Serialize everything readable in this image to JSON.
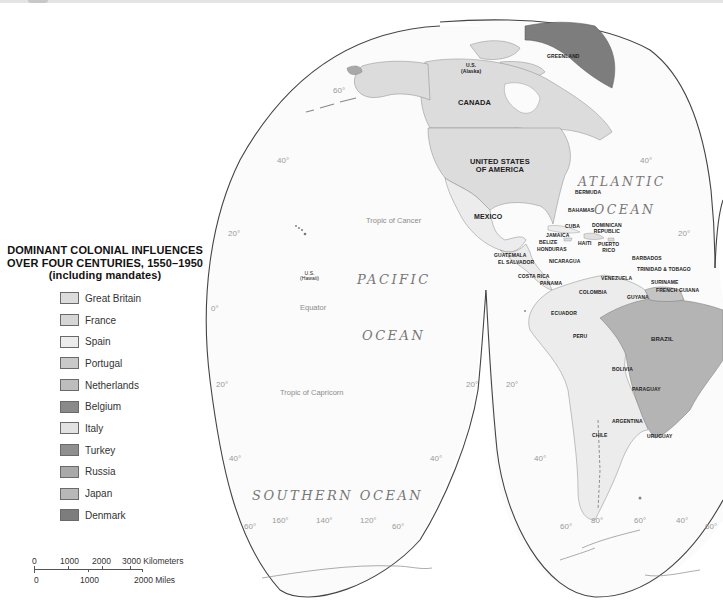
{
  "legend": {
    "title_line1": "DOMINANT COLONIAL INFLUENCES",
    "title_line2": "OVER FOUR CENTURIES, 1550–1950",
    "title_line3": "(including mandates)",
    "items": [
      {
        "label": "Great Britain",
        "color": "#dcdcdc"
      },
      {
        "label": "France",
        "color": "#d6d6d6"
      },
      {
        "label": "Spain",
        "color": "#ececec"
      },
      {
        "label": "Portugal",
        "color": "#c9c9c9"
      },
      {
        "label": "Netherlands",
        "color": "#bdbdbd"
      },
      {
        "label": "Belgium",
        "color": "#8a8a8a"
      },
      {
        "label": "Italy",
        "color": "#e2e2e2"
      },
      {
        "label": "Turkey",
        "color": "#8f8f8f"
      },
      {
        "label": "Russia",
        "color": "#a9a9a9"
      },
      {
        "label": "Japan",
        "color": "#b8b8b8"
      },
      {
        "label": "Denmark",
        "color": "#7d7d7d"
      }
    ]
  },
  "scale_bar": {
    "km_labels": [
      "0",
      "1000",
      "2000",
      "3000 Kilometers"
    ],
    "mi_labels": [
      "0",
      "1000",
      "2000 Miles"
    ]
  },
  "oceans": {
    "atlantic_line1": "ATLANTIC",
    "atlantic_line2": "OCEAN",
    "pacific_line1": "PACIFIC",
    "pacific_line2": "OCEAN",
    "southern": "SOUTHERN OCEAN"
  },
  "lines": {
    "tropic_cancer": "Tropic of Cancer",
    "equator": "Equator",
    "tropic_capricorn": "Tropic of Capricorn"
  },
  "countries": {
    "greenland": "GREENLAND",
    "alaska_1": "U.S.",
    "alaska_2": "(Alaska)",
    "canada": "CANADA",
    "usa_1": "UNITED STATES",
    "usa_2": "OF AMERICA",
    "mexico": "MEXICO",
    "hawaii_1": "U.S.",
    "hawaii_2": "(Hawaii)",
    "bermuda": "BERMUDA",
    "bahamas": "BAHAMAS",
    "cuba": "CUBA",
    "dominican_1": "DOMINICAN",
    "dominican_2": "REPUBLIC",
    "jamaica": "JAMAICA",
    "haiti": "HAITI",
    "puerto_rico_1": "PUERTO",
    "puerto_rico_2": "RICO",
    "belize": "BELIZE",
    "honduras": "HONDURAS",
    "guatemala": "GUATEMALA",
    "el_salvador": "EL SALVADOR",
    "nicaragua": "NICARAGUA",
    "costa_rica": "COSTA RICA",
    "panama": "PANAMA",
    "barbados": "BARBADOS",
    "trinidad": "TRINIDAD & TOBAGO",
    "venezuela": "VENEZUELA",
    "suriname": "SURINAME",
    "french_guiana": "FRENCH GUIANA",
    "guyana": "GUYANA",
    "colombia": "COLOMBIA",
    "ecuador": "ECUADOR",
    "peru": "PERU",
    "brazil": "BRAZIL",
    "bolivia": "BOLIVIA",
    "paraguay": "PARAGUAY",
    "argentina": "ARGENTINA",
    "chile": "CHILE",
    "uruguay": "URUGUAY"
  },
  "graticule": {
    "pac_60n": "60°",
    "pac_40n": "40°",
    "pac_20n": "20°",
    "pac_0": "0°",
    "pac_20s_l": "20°",
    "pac_20s_r": "20°",
    "pac_40s_l": "40°",
    "pac_40s_r": "40°",
    "pac_60s_l": "60°",
    "pac_60s_r": "60°",
    "lon_160": "160°",
    "lon_140": "140°",
    "lon_120": "120°",
    "atl_40n": "40°",
    "atl_20n": "20°",
    "sa_20s": "20°",
    "sa_40s": "40°",
    "sa_60s_l": "60°",
    "lon_80": "80°",
    "lon_60": "60°",
    "lon_40": "40°",
    "sa_60s_r": "60°"
  }
}
